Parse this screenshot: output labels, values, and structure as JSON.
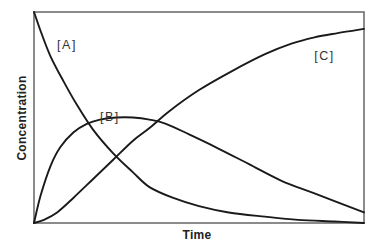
{
  "chart_data": {
    "type": "line",
    "title": "",
    "xlabel": "Time",
    "ylabel": "Concentration",
    "xlim": [
      0,
      1
    ],
    "ylim": [
      0,
      1
    ],
    "grid": false,
    "legend": "none (inline curve labels)",
    "x_ticks": [],
    "y_ticks": [],
    "units_note": "Axes have no numeric ticks; values are normalized (0-1) estimates read from curve shapes.",
    "series": [
      {
        "name": "[A]",
        "label": "[A]",
        "x": [
          0,
          0.02,
          0.05,
          0.09,
          0.13,
          0.18,
          0.24,
          0.3,
          0.35,
          0.42,
          0.5,
          0.59,
          0.7,
          0.8,
          0.91,
          1.0
        ],
        "y": [
          1.0,
          0.91,
          0.79,
          0.67,
          0.56,
          0.44,
          0.33,
          0.24,
          0.17,
          0.12,
          0.08,
          0.05,
          0.03,
          0.015,
          0.007,
          0.0
        ]
      },
      {
        "name": "[B]",
        "label": "[B]",
        "x": [
          0,
          0.02,
          0.05,
          0.08,
          0.12,
          0.16,
          0.2,
          0.25,
          0.3,
          0.35,
          0.4,
          0.47,
          0.55,
          0.65,
          0.75,
          0.85,
          1.0
        ],
        "y": [
          0.0,
          0.13,
          0.27,
          0.36,
          0.43,
          0.47,
          0.49,
          0.5,
          0.5,
          0.49,
          0.47,
          0.42,
          0.36,
          0.28,
          0.2,
          0.14,
          0.05
        ]
      },
      {
        "name": "[C]",
        "label": "[C]",
        "x": [
          0,
          0.03,
          0.07,
          0.12,
          0.18,
          0.24,
          0.3,
          0.35,
          0.41,
          0.5,
          0.6,
          0.7,
          0.78,
          0.85,
          0.92,
          1.0
        ],
        "y": [
          0.0,
          0.015,
          0.05,
          0.12,
          0.21,
          0.3,
          0.39,
          0.45,
          0.53,
          0.63,
          0.72,
          0.8,
          0.85,
          0.88,
          0.9,
          0.92
        ]
      }
    ],
    "annotations": [
      {
        "text": "[A]",
        "x": 0.1,
        "y": 0.84
      },
      {
        "text": "[B]",
        "x": 0.23,
        "y": 0.5
      },
      {
        "text": "[C]",
        "x": 0.88,
        "y": 0.79
      }
    ]
  }
}
